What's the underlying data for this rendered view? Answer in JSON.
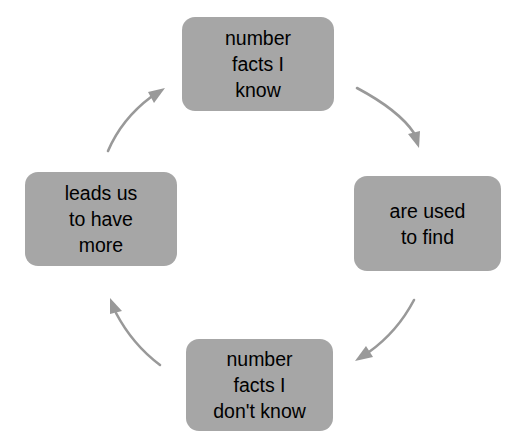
{
  "diagram": {
    "type": "cycle",
    "direction": "clockwise",
    "colors": {
      "node_fill": "#a6a6a6",
      "node_text": "#000000",
      "arrow": "#999999",
      "background": "#ffffff"
    },
    "nodes": [
      {
        "id": "top",
        "position": "top",
        "text": "number\nfacts I\nknow",
        "lines": [
          "number",
          "facts I",
          "know"
        ]
      },
      {
        "id": "right",
        "position": "right",
        "text": "are used\nto find",
        "lines": [
          "are used",
          "to find"
        ]
      },
      {
        "id": "bottom",
        "position": "bottom",
        "text": "number\nfacts I\ndon't know",
        "lines": [
          "number",
          "facts I",
          "don't know"
        ]
      },
      {
        "id": "left",
        "position": "left",
        "text": "leads us\nto have\nmore",
        "lines": [
          "leads us",
          "to have",
          "more"
        ]
      }
    ],
    "arrows": [
      {
        "id": "top-to-right",
        "from": "top",
        "to": "right",
        "icon": "curved-arrow-icon"
      },
      {
        "id": "right-to-bottom",
        "from": "right",
        "to": "bottom",
        "icon": "curved-arrow-icon"
      },
      {
        "id": "bottom-to-left",
        "from": "bottom",
        "to": "left",
        "icon": "curved-arrow-icon"
      },
      {
        "id": "left-to-top",
        "from": "left",
        "to": "top",
        "icon": "curved-arrow-icon"
      }
    ]
  }
}
